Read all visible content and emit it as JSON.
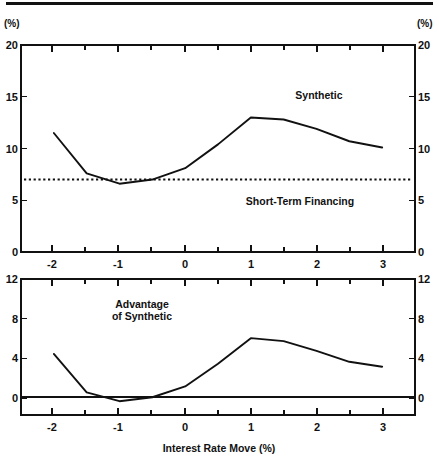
{
  "figure": {
    "header_rule": true,
    "x_axis_title": "Interest Rate Move (%)",
    "unit_label_left": "(%)",
    "unit_label_right": "(%)"
  },
  "panels": {
    "top": {
      "name": "Rate comparison panel",
      "y_unit_left": "(%)",
      "y_unit_right": "(%)",
      "y_ticks": [
        "0",
        "5",
        "10",
        "15",
        "20"
      ],
      "x_ticks": [
        "-2",
        "-1",
        "0",
        "1",
        "2",
        "3"
      ],
      "label_synthetic": "Synthetic",
      "label_short_term": "Short-Term Financing"
    },
    "bottom": {
      "name": "Advantage panel",
      "y_ticks": [
        "0",
        "4",
        "8",
        "12"
      ],
      "x_ticks": [
        "-2",
        "-1",
        "0",
        "1",
        "2",
        "3"
      ],
      "label_advantage_line1": "Advantage",
      "label_advantage_line2": "of Synthetic",
      "x_title": "Interest Rate Move (%)"
    }
  },
  "chart_data": [
    {
      "type": "line",
      "id": "top-panel",
      "title": "",
      "xlabel": "",
      "ylabel": "(%)",
      "xlim": [
        -2.5,
        3.5
      ],
      "ylim": [
        0,
        20
      ],
      "ytick_values": [
        0,
        5,
        10,
        15,
        20
      ],
      "xtick_values": [
        -2,
        -1,
        0,
        1,
        2,
        3
      ],
      "xtick_minor_step": 0.5,
      "ytick_minor": false,
      "grid": false,
      "legend": "inline annotations",
      "series": [
        {
          "name": "Synthetic",
          "style": "solid",
          "x": [
            -2.0,
            -1.5,
            -1.0,
            -0.5,
            0.0,
            0.5,
            1.0,
            1.5,
            2.0,
            2.5,
            3.0
          ],
          "values": [
            11.5,
            7.6,
            6.6,
            7.0,
            8.1,
            10.4,
            13.0,
            12.8,
            11.9,
            10.7,
            10.1
          ]
        },
        {
          "name": "Short-Term Financing",
          "style": "dotted",
          "x": [
            -2.5,
            3.5
          ],
          "values": [
            7.0,
            7.0
          ]
        }
      ],
      "annotations": [
        {
          "text": "Synthetic",
          "x": 1.45,
          "y": 15.0
        },
        {
          "text": "Short-Term Financing",
          "x": 1.35,
          "y": 4.9
        }
      ]
    },
    {
      "type": "line",
      "id": "bottom-panel",
      "title": "",
      "xlabel": "Interest Rate Move (%)",
      "ylabel": "",
      "xlim": [
        -2.5,
        3.5
      ],
      "ylim": [
        -1.8,
        12
      ],
      "ytick_values": [
        0,
        4,
        8,
        12
      ],
      "xtick_values": [
        -2,
        -1,
        0,
        1,
        2,
        3
      ],
      "xtick_minor_step": 0.5,
      "grid": false,
      "zero_line": true,
      "series": [
        {
          "name": "Advantage of Synthetic",
          "style": "solid",
          "x": [
            -2.0,
            -1.5,
            -1.0,
            -0.5,
            0.0,
            0.5,
            1.0,
            1.5,
            2.0,
            2.5,
            3.0
          ],
          "values": [
            4.4,
            0.5,
            -0.4,
            0.0,
            1.1,
            3.4,
            6.0,
            5.7,
            4.7,
            3.6,
            3.1
          ]
        }
      ],
      "annotations": [
        {
          "text": "Advantage",
          "x": -0.85,
          "y": 8.6
        },
        {
          "text": "of Synthetic",
          "x": -0.85,
          "y": 7.0
        }
      ]
    }
  ]
}
